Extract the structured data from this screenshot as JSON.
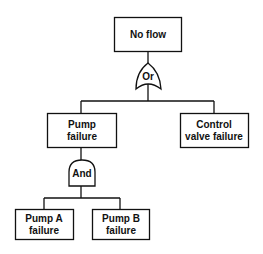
{
  "diagram": {
    "type": "fault-tree",
    "top_event": {
      "lines": [
        "No flow"
      ]
    },
    "or_gate": {
      "label": "Or"
    },
    "intermediate": [
      {
        "id": "pump",
        "lines": [
          "Pump",
          "failure"
        ]
      },
      {
        "id": "valve",
        "lines": [
          "Control",
          "valve failure"
        ]
      }
    ],
    "and_gate": {
      "label": "And"
    },
    "basic_events": [
      {
        "id": "pumpA",
        "lines": [
          "Pump A",
          "failure"
        ]
      },
      {
        "id": "pumpB",
        "lines": [
          "Pump B",
          "failure"
        ]
      }
    ],
    "colors": {
      "line": "#111111",
      "background": "#ffffff"
    }
  }
}
